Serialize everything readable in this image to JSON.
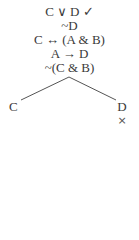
{
  "tree": {
    "trunk": [
      {
        "formula": "C ∨ D",
        "mark": "✓"
      },
      {
        "formula": "~D",
        "mark": ""
      },
      {
        "formula": "C ↔ (A & B)",
        "mark": ""
      },
      {
        "formula": "A → D",
        "mark": ""
      },
      {
        "formula": "~(C & B)",
        "mark": ""
      }
    ],
    "branches": [
      {
        "formula": "C",
        "closed": false,
        "mark": ""
      },
      {
        "formula": "D",
        "closed": true,
        "mark": "×"
      }
    ]
  },
  "colors": {
    "text": "#3a3a3a",
    "line": "#555555"
  }
}
